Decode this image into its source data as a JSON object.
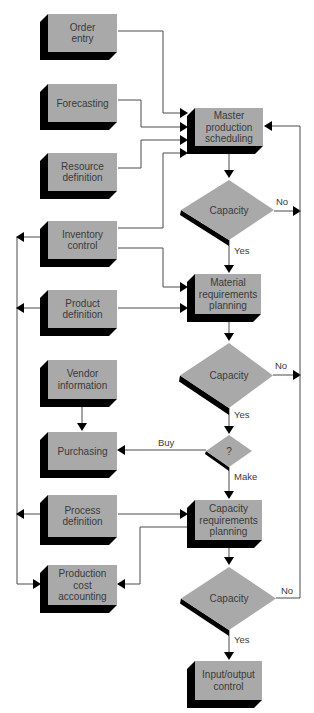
{
  "diagram": {
    "colors": {
      "face": "#a9a9a9",
      "shadow": "#000000",
      "line": "#4a4a4a",
      "background": "#ffffff"
    },
    "boxes": [
      {
        "id": "order-entry",
        "lines": [
          "Order",
          "entry"
        ],
        "x": 48,
        "y": 14,
        "w": 69,
        "h": 38
      },
      {
        "id": "forecasting",
        "lines": [
          "Forecasting"
        ],
        "x": 48,
        "y": 84,
        "w": 69,
        "h": 38
      },
      {
        "id": "resource-definition",
        "lines": [
          "Resource",
          "definition"
        ],
        "x": 48,
        "y": 153,
        "w": 69,
        "h": 38
      },
      {
        "id": "inventory-control",
        "lines": [
          "Inventory",
          "control"
        ],
        "x": 48,
        "y": 221,
        "w": 69,
        "h": 38
      },
      {
        "id": "product-definition",
        "lines": [
          "Product",
          "definition"
        ],
        "x": 48,
        "y": 290,
        "w": 69,
        "h": 38
      },
      {
        "id": "vendor-information",
        "lines": [
          "Vendor",
          "information"
        ],
        "x": 48,
        "y": 360,
        "w": 69,
        "h": 39
      },
      {
        "id": "purchasing",
        "lines": [
          "Purchasing"
        ],
        "x": 48,
        "y": 432,
        "w": 69,
        "h": 38
      },
      {
        "id": "process-definition",
        "lines": [
          "Process",
          "definition"
        ],
        "x": 48,
        "y": 495,
        "w": 69,
        "h": 42
      },
      {
        "id": "production-cost-accounting",
        "lines": [
          "Production",
          "cost",
          "accounting"
        ],
        "x": 48,
        "y": 565,
        "w": 69,
        "h": 40
      },
      {
        "id": "master-production-scheduling",
        "lines": [
          "Master",
          "production",
          "scheduling"
        ],
        "x": 195,
        "y": 108,
        "w": 68,
        "h": 38
      },
      {
        "id": "material-requirements-planning",
        "lines": [
          "Material",
          "requirements",
          "planning"
        ],
        "x": 195,
        "y": 274,
        "w": 66,
        "h": 40
      },
      {
        "id": "capacity-requirements-planning",
        "lines": [
          "Capacity",
          "requirements",
          "planning"
        ],
        "x": 195,
        "y": 500,
        "w": 67,
        "h": 40
      },
      {
        "id": "input-output-control",
        "lines": [
          "Input/output",
          "control"
        ],
        "x": 195,
        "y": 661,
        "w": 67,
        "h": 39
      }
    ],
    "decisions": [
      {
        "id": "capacity-1",
        "label": "Capacity",
        "cx": 229,
        "top": 180,
        "bottom": 240,
        "left": 181,
        "right": 274
      },
      {
        "id": "capacity-2",
        "label": "Capacity",
        "cx": 229,
        "top": 343,
        "bottom": 408,
        "left": 180,
        "right": 273
      },
      {
        "id": "make-or-buy",
        "label": "?",
        "cx": 229,
        "top": 435,
        "bottom": 467,
        "left": 206,
        "right": 252
      },
      {
        "id": "capacity-3",
        "label": "Capacity",
        "cx": 229,
        "top": 567,
        "bottom": 630,
        "left": 181,
        "right": 276
      }
    ],
    "edges": [
      {
        "id": "order-entry-to-mps",
        "points": [
          [
            118,
            31
          ],
          [
            163,
            31
          ],
          [
            163,
            113
          ],
          [
            180,
            113
          ]
        ],
        "arrow": "right"
      },
      {
        "id": "forecasting-to-mps",
        "points": [
          [
            118,
            100
          ],
          [
            141,
            100
          ],
          [
            141,
            127
          ],
          [
            180,
            127
          ]
        ],
        "arrow": "right"
      },
      {
        "id": "resource-to-mps",
        "points": [
          [
            118,
            168
          ],
          [
            141,
            168
          ],
          [
            141,
            140
          ],
          [
            180,
            140
          ]
        ],
        "arrow": "right"
      },
      {
        "id": "inventory-to-mps",
        "points": [
          [
            118,
            228
          ],
          [
            163,
            228
          ],
          [
            163,
            153
          ],
          [
            180,
            153
          ]
        ],
        "arrow": "right"
      },
      {
        "id": "mps-to-capacity-1",
        "points": [
          [
            229,
            152
          ],
          [
            229,
            170
          ]
        ],
        "arrow": "down"
      },
      {
        "id": "capacity-1-no",
        "points": [
          [
            274,
            211
          ],
          [
            293,
            211
          ]
        ],
        "arrow": "right"
      },
      {
        "id": "capacity-1-yes",
        "points": [
          [
            229,
            240
          ],
          [
            229,
            265
          ]
        ],
        "arrow": "down"
      },
      {
        "id": "inventory-to-mrp",
        "points": [
          [
            118,
            248
          ],
          [
            163,
            248
          ],
          [
            163,
            287
          ],
          [
            180,
            287
          ]
        ],
        "arrow": "right"
      },
      {
        "id": "product-to-mrp",
        "points": [
          [
            118,
            308
          ],
          [
            180,
            308
          ]
        ],
        "arrow": "right"
      },
      {
        "id": "mrp-to-capacity-2",
        "points": [
          [
            229,
            320
          ],
          [
            229,
            333
          ]
        ],
        "arrow": "down"
      },
      {
        "id": "capacity-2-no",
        "points": [
          [
            273,
            375
          ],
          [
            293,
            375
          ]
        ],
        "arrow": "right"
      },
      {
        "id": "capacity-2-yes",
        "points": [
          [
            229,
            408
          ],
          [
            229,
            426
          ]
        ],
        "arrow": "down"
      },
      {
        "id": "buy-to-purchasing",
        "points": [
          [
            206,
            450
          ],
          [
            125,
            450
          ]
        ],
        "arrow": "left"
      },
      {
        "id": "vendor-to-purchasing",
        "points": [
          [
            82,
            405
          ],
          [
            82,
            423
          ]
        ],
        "arrow": "down"
      },
      {
        "id": "make-to-crp",
        "points": [
          [
            229,
            467
          ],
          [
            229,
            491
          ]
        ],
        "arrow": "down"
      },
      {
        "id": "process-to-crp",
        "points": [
          [
            118,
            514
          ],
          [
            180,
            514
          ]
        ],
        "arrow": "right"
      },
      {
        "id": "crp-to-cost-accounting",
        "points": [
          [
            187,
            527
          ],
          [
            140,
            527
          ],
          [
            140,
            584
          ],
          [
            125,
            584
          ]
        ],
        "arrow": "left"
      },
      {
        "id": "crp-to-capacity-3",
        "points": [
          [
            229,
            546
          ],
          [
            229,
            557
          ]
        ],
        "arrow": "down"
      },
      {
        "id": "capacity-3-no-feedback",
        "points": [
          [
            276,
            598
          ],
          [
            300,
            598
          ],
          [
            300,
            126
          ],
          [
            272,
            126
          ]
        ],
        "arrow": "left"
      },
      {
        "id": "capacity-3-yes",
        "points": [
          [
            229,
            630
          ],
          [
            229,
            652
          ]
        ],
        "arrow": "down"
      },
      {
        "id": "left-bus",
        "points": [
          [
            17,
            237
          ],
          [
            17,
            584
          ],
          [
            33,
            584
          ]
        ],
        "arrow": "right"
      },
      {
        "id": "inventory-to-left-bus",
        "points": [
          [
            40,
            237
          ],
          [
            24,
            237
          ]
        ],
        "arrow": "left"
      },
      {
        "id": "product-to-left-bus",
        "points": [
          [
            40,
            308
          ],
          [
            24,
            308
          ]
        ],
        "arrow": "left"
      },
      {
        "id": "process-to-left-bus",
        "points": [
          [
            40,
            514
          ],
          [
            24,
            514
          ]
        ],
        "arrow": "left"
      }
    ],
    "edge_labels": [
      {
        "id": "label-no-1",
        "text": "No",
        "x": 276,
        "y": 205
      },
      {
        "id": "label-yes-1",
        "text": "Yes",
        "x": 234,
        "y": 254
      },
      {
        "id": "label-no-2",
        "text": "No",
        "x": 275,
        "y": 369
      },
      {
        "id": "label-yes-2",
        "text": "Yes",
        "x": 234,
        "y": 418
      },
      {
        "id": "label-buy",
        "text": "Buy",
        "x": 158,
        "y": 446
      },
      {
        "id": "label-make",
        "text": "Make",
        "x": 234,
        "y": 480
      },
      {
        "id": "label-no-3",
        "text": "No",
        "x": 281,
        "y": 594
      },
      {
        "id": "label-yes-3",
        "text": "Yes",
        "x": 234,
        "y": 643
      }
    ]
  }
}
